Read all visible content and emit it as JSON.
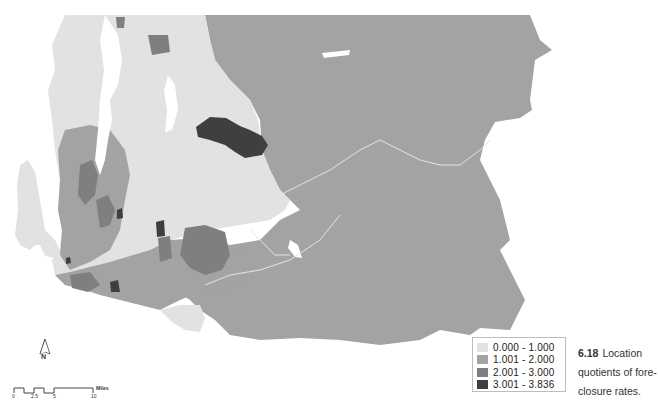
{
  "map": {
    "title": "Location quotients of foreclosure rates",
    "region": "King County, WA (census tracts)",
    "colors": {
      "class1": "#e2e2e2",
      "class2": "#a3a3a3",
      "class3": "#7f7f7f",
      "class4": "#3f3f3f",
      "water": "#ffffff",
      "boundary": "#f2f2f2"
    }
  },
  "legend": {
    "items": [
      {
        "label": "0.000 - 1.000",
        "color": "#e2e2e2"
      },
      {
        "label": "1.001 - 2.000",
        "color": "#a3a3a3"
      },
      {
        "label": "2.001 - 3.000",
        "color": "#7f7f7f"
      },
      {
        "label": "3.001 - 3.836",
        "color": "#3f3f3f"
      }
    ]
  },
  "caption": {
    "number": "6.18",
    "text": "Location quotients of fore-closure rates."
  },
  "north_arrow": {
    "label": "N"
  },
  "scale_bar": {
    "ticks": [
      "0",
      "2.5",
      "5",
      "10"
    ],
    "unit": "Miles"
  }
}
